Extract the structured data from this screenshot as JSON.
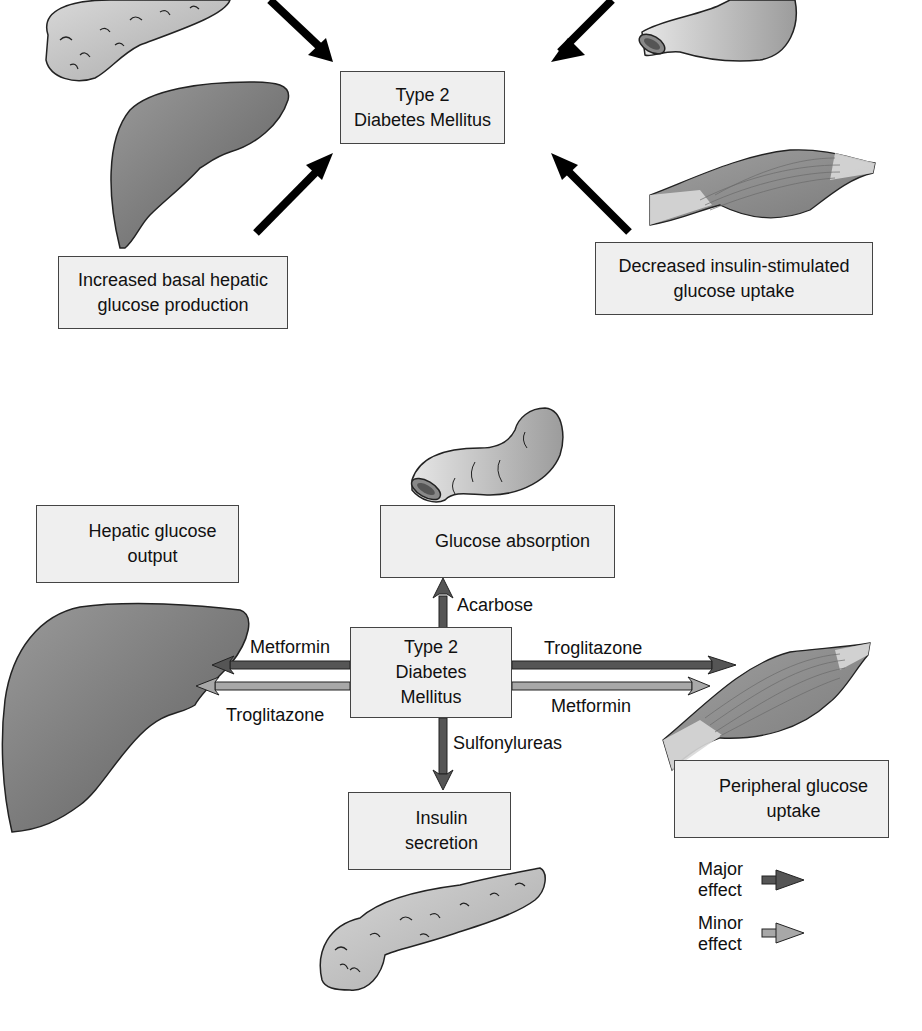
{
  "top_panel": {
    "center_box": {
      "line1": "Type 2",
      "line2": "Diabetes Mellitus"
    },
    "liver_box": {
      "line1": "Increased basal hepatic",
      "line2": "glucose production"
    },
    "muscle_box": {
      "line1": "Decreased insulin-stimulated",
      "line2": "glucose uptake"
    },
    "organs": [
      "pancreas-icon",
      "intestine-icon",
      "liver-icon",
      "muscle-icon"
    ]
  },
  "bottom_panel": {
    "center_box": {
      "line1": "Type 2",
      "line2": "Diabetes",
      "line3": "Mellitus"
    },
    "hepatic_box": {
      "direction": "down",
      "line1": "Hepatic glucose",
      "line2": "output"
    },
    "absorption_box": {
      "direction": "down",
      "line1": "Glucose absorption"
    },
    "insulin_box": {
      "direction": "up",
      "line1": "Insulin",
      "line2": "secretion"
    },
    "peripheral_box": {
      "direction": "up",
      "line1": "Peripheral glucose",
      "line2": "uptake"
    },
    "drug_labels": {
      "acarbose": "Acarbose",
      "metformin_liver": "Metformin",
      "troglitazone_liver": "Troglitazone",
      "troglitazone_muscle": "Troglitazone",
      "metformin_muscle": "Metformin",
      "sulfonylureas": "Sulfonylureas"
    },
    "legend": {
      "major": {
        "line1": "Major",
        "line2": "effect",
        "color": "#555555"
      },
      "minor": {
        "line1": "Minor",
        "line2": "effect",
        "color": "#a8a8a8"
      }
    }
  },
  "colors": {
    "box_fill": "#efefef",
    "major_arrow": "#555555",
    "minor_arrow": "#a8a8a8",
    "liver": "#7a7a7a",
    "pancreas": "#c8c8c8",
    "muscle": "#8c8c8c"
  }
}
